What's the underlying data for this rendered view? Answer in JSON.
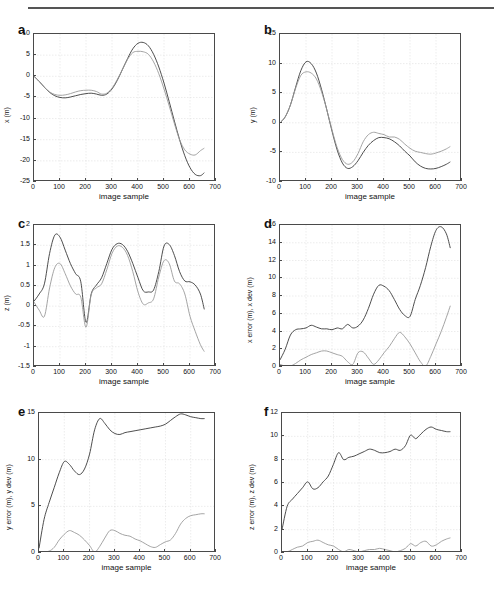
{
  "figure": {
    "background": "#ffffff",
    "top_rule_color": "#555555",
    "axis_color": "#4a4a4a",
    "grid_color": "#d8d8d8",
    "series_colors": {
      "primary": "#3a3a3a",
      "secondary": "#9a9a9a"
    }
  },
  "chart_data": [
    {
      "type": "line",
      "panel": "a",
      "title": "",
      "xlabel": "image sample",
      "ylabel": "x (m)",
      "xlim": [
        0,
        700
      ],
      "ylim": [
        -25,
        10
      ],
      "xticks": [
        0,
        100,
        200,
        300,
        400,
        500,
        600,
        700
      ],
      "yticks": [
        -25,
        -20,
        -15,
        -10,
        -5,
        0,
        5,
        10
      ],
      "grid": true,
      "legend": "none",
      "x": [
        0,
        20,
        40,
        60,
        80,
        100,
        120,
        140,
        160,
        180,
        200,
        220,
        240,
        260,
        280,
        300,
        320,
        340,
        360,
        380,
        400,
        420,
        440,
        460,
        480,
        500,
        520,
        540,
        560,
        580,
        600,
        620,
        640,
        655
      ],
      "series": [
        {
          "name": "ground truth x",
          "color": "#3a3a3a",
          "values": [
            0,
            -1.2,
            -2.6,
            -3.8,
            -4.6,
            -5.0,
            -5.1,
            -4.9,
            -4.6,
            -4.3,
            -4.1,
            -4.0,
            -4.2,
            -4.5,
            -4.2,
            -3.0,
            -1.0,
            1.6,
            4.2,
            6.5,
            7.8,
            8.0,
            7.2,
            5.2,
            2.2,
            -1.6,
            -6.0,
            -10.6,
            -15.0,
            -18.8,
            -21.6,
            -23.2,
            -23.5,
            -22.8
          ]
        },
        {
          "name": "estimated x",
          "color": "#9a9a9a",
          "values": [
            0,
            -1.2,
            -2.6,
            -3.7,
            -4.3,
            -4.5,
            -4.4,
            -4.1,
            -3.7,
            -3.4,
            -3.3,
            -3.3,
            -3.6,
            -4.2,
            -4.0,
            -2.8,
            -0.8,
            1.6,
            4.0,
            5.6,
            5.9,
            5.8,
            5.2,
            3.4,
            0.6,
            -3.0,
            -7.0,
            -11.2,
            -15.0,
            -17.4,
            -18.4,
            -18.6,
            -17.6,
            -17.0
          ]
        }
      ]
    },
    {
      "type": "line",
      "panel": "b",
      "title": "",
      "xlabel": "image sample",
      "ylabel": "y (m)",
      "xlim": [
        0,
        700
      ],
      "ylim": [
        -10,
        15
      ],
      "xticks": [
        0,
        100,
        200,
        300,
        400,
        500,
        600,
        700
      ],
      "yticks": [
        -10,
        -5,
        0,
        5,
        10,
        15
      ],
      "grid": true,
      "legend": "none",
      "x": [
        0,
        20,
        40,
        60,
        80,
        100,
        120,
        140,
        160,
        180,
        200,
        220,
        240,
        260,
        280,
        300,
        320,
        340,
        360,
        380,
        400,
        420,
        440,
        460,
        480,
        500,
        520,
        540,
        560,
        580,
        600,
        620,
        640,
        655
      ],
      "series": [
        {
          "name": "ground truth y",
          "color": "#3a3a3a",
          "values": [
            0,
            1.0,
            3.0,
            6.0,
            8.8,
            10.3,
            10.0,
            8.4,
            5.6,
            2.2,
            -1.4,
            -4.6,
            -6.8,
            -7.7,
            -7.4,
            -6.4,
            -5.0,
            -3.8,
            -3.0,
            -2.5,
            -2.5,
            -2.7,
            -3.2,
            -3.9,
            -4.8,
            -5.6,
            -6.6,
            -7.3,
            -7.7,
            -7.8,
            -7.7,
            -7.4,
            -7.0,
            -6.6
          ]
        },
        {
          "name": "estimated y",
          "color": "#9a9a9a",
          "values": [
            0,
            1.0,
            3.0,
            5.8,
            8.0,
            8.6,
            8.4,
            7.4,
            5.2,
            2.2,
            -1.2,
            -4.2,
            -6.2,
            -7.0,
            -6.6,
            -5.2,
            -3.2,
            -2.0,
            -1.6,
            -1.8,
            -2.0,
            -2.4,
            -2.4,
            -2.8,
            -3.6,
            -4.3,
            -4.8,
            -5.0,
            -5.2,
            -5.3,
            -5.1,
            -4.8,
            -4.4,
            -4.0
          ]
        }
      ]
    },
    {
      "type": "line",
      "panel": "c",
      "title": "",
      "xlabel": "image sample",
      "ylabel": "z (m)",
      "xlim": [
        0,
        700
      ],
      "ylim": [
        -1.5,
        2
      ],
      "xticks": [
        0,
        100,
        200,
        300,
        400,
        500,
        600,
        700
      ],
      "yticks": [
        -1.5,
        -1,
        -0.5,
        0,
        0.5,
        1,
        1.5,
        2
      ],
      "grid": true,
      "legend": "none",
      "x": [
        0,
        20,
        40,
        60,
        80,
        100,
        120,
        140,
        160,
        180,
        200,
        220,
        240,
        260,
        280,
        300,
        320,
        340,
        360,
        380,
        400,
        420,
        440,
        460,
        480,
        500,
        520,
        540,
        560,
        580,
        600,
        620,
        640,
        655
      ],
      "series": [
        {
          "name": "ground truth z",
          "color": "#3a3a3a",
          "values": [
            0.12,
            0.3,
            0.55,
            1.3,
            1.75,
            1.7,
            1.38,
            1.05,
            0.8,
            0.6,
            -0.4,
            0.3,
            0.52,
            0.7,
            1.05,
            1.4,
            1.54,
            1.52,
            1.35,
            1.05,
            0.7,
            0.38,
            0.35,
            0.4,
            0.85,
            1.48,
            1.52,
            1.25,
            0.85,
            0.62,
            0.6,
            0.52,
            0.3,
            -0.08
          ]
        },
        {
          "name": "estimated z",
          "color": "#9a9a9a",
          "values": [
            0.1,
            -0.1,
            -0.25,
            0.45,
            0.95,
            1.05,
            0.8,
            0.5,
            0.3,
            0.22,
            -0.52,
            0.28,
            0.45,
            0.55,
            0.9,
            1.3,
            1.48,
            1.45,
            1.25,
            0.85,
            0.35,
            0.05,
            0.08,
            0.18,
            0.72,
            1.12,
            1.05,
            0.62,
            0.55,
            0.3,
            -0.25,
            -0.62,
            -0.95,
            -1.12
          ]
        }
      ]
    },
    {
      "type": "line",
      "panel": "d",
      "title": "",
      "xlabel": "image sample",
      "ylabel": "x error (m), x dev (m)",
      "xlim": [
        0,
        700
      ],
      "ylim": [
        0,
        16
      ],
      "xticks": [
        0,
        100,
        200,
        300,
        400,
        500,
        600,
        700
      ],
      "yticks": [
        0,
        2,
        4,
        6,
        8,
        10,
        12,
        14,
        16
      ],
      "grid": true,
      "legend": "none",
      "x": [
        0,
        20,
        40,
        60,
        80,
        100,
        120,
        140,
        160,
        180,
        200,
        220,
        240,
        260,
        280,
        300,
        320,
        340,
        360,
        380,
        400,
        420,
        440,
        460,
        480,
        500,
        520,
        540,
        560,
        580,
        600,
        620,
        640,
        655
      ],
      "series": [
        {
          "name": "x error",
          "color": "#3a3a3a",
          "values": [
            0.8,
            2.0,
            3.6,
            4.2,
            4.3,
            4.4,
            4.7,
            4.5,
            4.3,
            4.3,
            4.2,
            4.4,
            4.3,
            4.8,
            4.4,
            4.6,
            5.3,
            6.6,
            8.2,
            9.2,
            9.1,
            8.6,
            7.6,
            6.5,
            5.8,
            5.7,
            7.6,
            9.2,
            11.2,
            13.6,
            15.4,
            15.8,
            15.0,
            13.4
          ]
        },
        {
          "name": "x dev",
          "color": "#9a9a9a",
          "values": [
            0.3,
            0.1,
            0.1,
            0.4,
            0.8,
            1.1,
            1.4,
            1.6,
            1.8,
            1.8,
            1.6,
            1.4,
            1.2,
            0.6,
            0.3,
            1.6,
            1.7,
            1.0,
            0.3,
            0.8,
            1.6,
            2.3,
            3.2,
            3.9,
            3.4,
            2.6,
            1.6,
            0.6,
            0.1,
            1.2,
            2.6,
            4.0,
            5.6,
            6.9
          ]
        }
      ]
    },
    {
      "type": "line",
      "panel": "e",
      "title": "",
      "xlabel": "image sample",
      "ylabel": "y error (m), y dev (m)",
      "xlim": [
        0,
        700
      ],
      "ylim": [
        0,
        15
      ],
      "xticks": [
        0,
        100,
        200,
        300,
        400,
        500,
        600,
        700
      ],
      "yticks": [
        0,
        5,
        10,
        15
      ],
      "grid": true,
      "legend": "none",
      "x": [
        0,
        20,
        40,
        60,
        80,
        100,
        120,
        140,
        160,
        180,
        200,
        220,
        240,
        260,
        280,
        300,
        320,
        340,
        360,
        380,
        400,
        420,
        440,
        460,
        480,
        500,
        520,
        540,
        560,
        580,
        600,
        620,
        640,
        655
      ],
      "series": [
        {
          "name": "y error",
          "color": "#3a3a3a",
          "values": [
            0.5,
            3.6,
            5.4,
            7.0,
            8.6,
            9.8,
            9.5,
            8.8,
            8.4,
            9.0,
            10.6,
            13.2,
            14.4,
            13.9,
            13.2,
            12.8,
            12.7,
            12.9,
            13.0,
            13.1,
            13.2,
            13.3,
            13.4,
            13.5,
            13.6,
            13.8,
            14.2,
            14.6,
            14.9,
            14.8,
            14.6,
            14.5,
            14.4,
            14.4
          ]
        },
        {
          "name": "y dev",
          "color": "#9a9a9a",
          "values": [
            0.1,
            0.1,
            0.2,
            0.6,
            1.4,
            2.0,
            2.4,
            2.2,
            1.9,
            1.4,
            0.8,
            0.1,
            0.7,
            1.6,
            2.4,
            2.4,
            2.1,
            1.9,
            1.8,
            1.5,
            1.3,
            1.0,
            0.7,
            0.6,
            0.9,
            1.2,
            1.4,
            2.1,
            3.1,
            3.7,
            4.0,
            4.1,
            4.2,
            4.2
          ]
        }
      ]
    },
    {
      "type": "line",
      "panel": "f",
      "title": "",
      "xlabel": "image sample",
      "ylabel": "z error (m), z dev (m)",
      "xlim": [
        0,
        700
      ],
      "ylim": [
        0,
        12
      ],
      "xticks": [
        0,
        100,
        200,
        300,
        400,
        500,
        600,
        700
      ],
      "yticks": [
        0,
        2,
        4,
        6,
        8,
        10,
        12
      ],
      "grid": true,
      "legend": "none",
      "x": [
        0,
        20,
        40,
        60,
        80,
        100,
        120,
        140,
        160,
        180,
        200,
        220,
        240,
        260,
        280,
        300,
        320,
        340,
        360,
        380,
        400,
        420,
        440,
        460,
        480,
        500,
        520,
        540,
        560,
        580,
        600,
        620,
        640,
        655
      ],
      "series": [
        {
          "name": "z error",
          "color": "#3a3a3a",
          "values": [
            2.0,
            4.0,
            4.6,
            5.1,
            5.6,
            6.1,
            5.5,
            5.6,
            6.1,
            6.6,
            7.6,
            8.6,
            8.0,
            8.2,
            8.3,
            8.5,
            8.7,
            8.9,
            8.8,
            8.6,
            8.6,
            8.7,
            8.9,
            8.8,
            9.2,
            10.1,
            9.8,
            10.2,
            10.6,
            10.8,
            10.6,
            10.5,
            10.4,
            10.4
          ]
        },
        {
          "name": "z dev",
          "color": "#9a9a9a",
          "values": [
            0.1,
            0.1,
            0.3,
            0.5,
            0.6,
            0.9,
            1.0,
            1.1,
            0.9,
            0.7,
            0.6,
            0.3,
            0.1,
            0.3,
            0.2,
            0.1,
            0.2,
            0.3,
            0.3,
            0.4,
            0.3,
            0.2,
            0.1,
            0.2,
            0.4,
            0.8,
            0.6,
            0.9,
            1.0,
            0.6,
            0.7,
            1.0,
            1.2,
            1.3
          ]
        }
      ]
    }
  ],
  "panels": [
    {
      "letter": "a"
    },
    {
      "letter": "b"
    },
    {
      "letter": "c"
    },
    {
      "letter": "d"
    },
    {
      "letter": "e"
    },
    {
      "letter": "f"
    }
  ]
}
